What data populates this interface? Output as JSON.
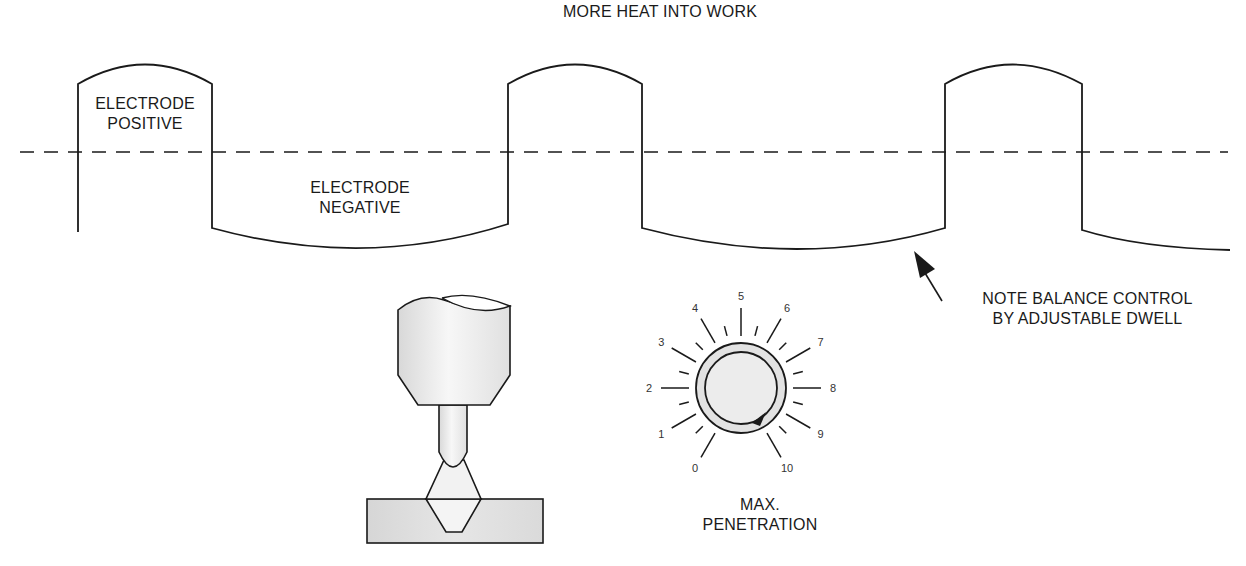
{
  "title": "MORE HEAT INTO WORK",
  "waveform": {
    "positive_label": [
      "ELECTRODE",
      "POSITIVE"
    ],
    "negative_label": [
      "ELECTRODE",
      "NEGATIVE"
    ],
    "baseline": "dashed zero line"
  },
  "annotation": {
    "line1": "NOTE BALANCE CONTROL",
    "line2": "BY ADJUSTABLE DWELL"
  },
  "dial": {
    "numbers": [
      "0",
      "1",
      "2",
      "3",
      "4",
      "5",
      "6",
      "7",
      "8",
      "9",
      "10"
    ],
    "caption_line1": "MAX.",
    "caption_line2": "PENETRATION",
    "pointer_position": "near 9-10"
  },
  "illustration": {
    "name": "TIG torch with tungsten electrode over V-groove weld joint"
  },
  "colors": {
    "line": "#1a1a1a",
    "shade": "#e4e4e4",
    "background": "#ffffff"
  }
}
